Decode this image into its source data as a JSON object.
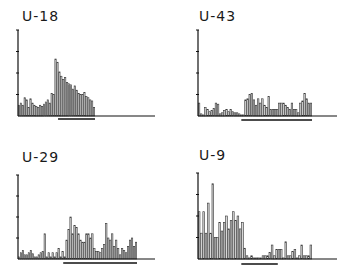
{
  "chart_data": [
    {
      "type": "bar",
      "title": "U-18",
      "xlabel": "",
      "ylabel": "",
      "ylim": [
        0,
        4
      ],
      "y_ticks": 4,
      "tick_labels": [],
      "grid": false,
      "underline_range": [
        0.52,
        1.0
      ],
      "values": [
        0.5,
        0.6,
        0.5,
        0.85,
        0.75,
        0.4,
        0.8,
        0.6,
        0.5,
        0.45,
        0.4,
        0.5,
        0.45,
        0.55,
        0.65,
        0.75,
        0.6,
        1.05,
        1.0,
        2.65,
        2.5,
        2.05,
        1.85,
        1.7,
        1.8,
        1.55,
        1.5,
        1.45,
        1.25,
        1.4,
        1.2,
        1.05,
        1.0,
        1.0,
        1.1,
        0.9,
        0.85,
        0.75,
        0.7,
        0.4
      ]
    },
    {
      "type": "bar",
      "title": "U-43",
      "xlabel": "",
      "ylabel": "",
      "ylim": [
        0,
        4
      ],
      "y_ticks": 4,
      "tick_labels": [],
      "grid": false,
      "underline_range": [
        0.38,
        1.0
      ],
      "values": [
        0.6,
        0.1,
        0.05,
        0.4,
        0.3,
        0.2,
        0.25,
        0.35,
        0.6,
        0.55,
        0.1,
        0.15,
        0.25,
        0.3,
        0.2,
        0.3,
        0.2,
        0.15,
        0.15,
        0.1,
        0.05,
        0.05,
        0.75,
        0.8,
        1.0,
        1.05,
        0.75,
        0.5,
        0.8,
        0.6,
        0.8,
        0.5,
        0.4,
        0.9,
        0.3,
        0.3,
        0.3,
        0.3,
        0.6,
        0.6,
        0.6,
        0.5,
        0.4,
        0.3,
        0.6,
        0.3,
        0.3,
        0.15,
        0.6,
        0.7,
        1.05,
        0.8,
        0.6,
        0.6
      ]
    },
    {
      "type": "bar",
      "title": "U-29",
      "xlabel": "",
      "ylabel": "",
      "ylim": [
        0,
        4
      ],
      "y_ticks": 4,
      "tick_labels": [],
      "grid": false,
      "underline_range": [
        0.38,
        1.0
      ],
      "values": [
        0.1,
        0.3,
        0.4,
        0.2,
        0.2,
        0.3,
        0.4,
        0.25,
        0.1,
        0.1,
        0.2,
        0.3,
        0.35,
        1.2,
        0.1,
        0.3,
        0.1,
        0.3,
        0.1,
        0.3,
        0.5,
        0.1,
        0.35,
        0.1,
        0.9,
        1.4,
        2.0,
        1.2,
        1.6,
        1.5,
        1.2,
        0.9,
        0.8,
        0.8,
        1.2,
        1.2,
        1.0,
        1.2,
        0.5,
        0.35,
        0.35,
        0.3,
        0.5,
        0.7,
        1.7,
        1.0,
        0.9,
        1.2,
        0.6,
        0.9,
        0.5,
        0.2,
        0.5,
        0.4,
        0.3,
        0.6,
        0.9,
        1.0,
        0.6,
        0.8
      ]
    },
    {
      "type": "bar",
      "title": "U-9",
      "xlabel": "",
      "ylabel": "",
      "ylim": [
        0,
        4
      ],
      "y_ticks": 4,
      "tick_labels": [],
      "grid": false,
      "underline_range": [
        0.38,
        0.7
      ],
      "values": [
        2.2,
        1.2,
        2.2,
        1.2,
        2.6,
        1.2,
        3.5,
        1.0,
        1.0,
        1.7,
        1.3,
        1.7,
        2.0,
        1.4,
        1.8,
        2.2,
        1.8,
        2.0,
        1.4,
        1.7,
        0.5,
        0.15,
        0.05,
        0.15,
        0.05,
        0.05,
        0.05,
        0.05,
        0.15,
        0.15,
        0.15,
        0.3,
        0.65,
        0.15,
        0.45,
        0.45,
        0.45,
        0.05,
        0.8,
        0.15,
        0.15,
        0.35,
        0.45,
        0.05,
        0.15,
        0.65,
        0.15,
        0.15,
        0.15,
        0.65
      ]
    }
  ]
}
